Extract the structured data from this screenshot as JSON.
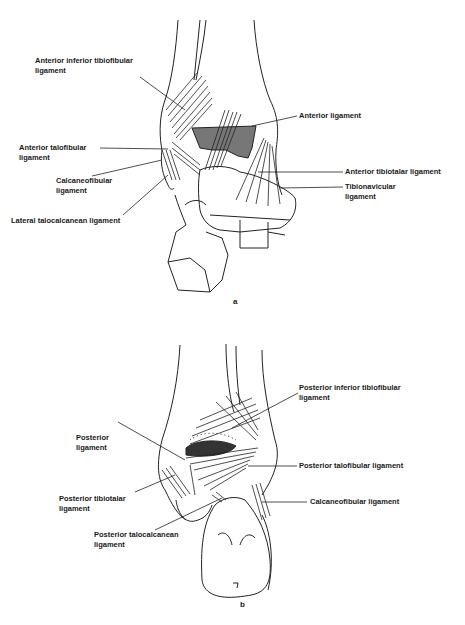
{
  "figure": {
    "panels": [
      {
        "id": "a",
        "caption": "a",
        "view": "anterior",
        "labels": [
          {
            "line1": "Anterior inferior tibiofibular",
            "line2": "ligament"
          },
          {
            "line1": "Anterior ligament",
            "line2": ""
          },
          {
            "line1": "Anterior talofibular",
            "line2": "ligament"
          },
          {
            "line1": "Calcaneofibular",
            "line2": "ligament"
          },
          {
            "line1": "Anterior tibiotalar ligament",
            "line2": ""
          },
          {
            "line1": "Tibionavicular",
            "line2": "ligament"
          },
          {
            "line1": "Lateral talocalcanean ligament",
            "line2": ""
          }
        ]
      },
      {
        "id": "b",
        "caption": "b",
        "view": "posterior",
        "labels": [
          {
            "line1": "Posterior inferior tibiofibular",
            "line2": "ligament"
          },
          {
            "line1": "Posterior",
            "line2": "ligament"
          },
          {
            "line1": "Posterior talofibular ligament",
            "line2": ""
          },
          {
            "line1": "Posterior tibiotalar",
            "line2": "ligament"
          },
          {
            "line1": "Calcaneofibular ligament",
            "line2": ""
          },
          {
            "line1": "Posterior talocalcanean",
            "line2": "ligament"
          }
        ]
      }
    ]
  }
}
